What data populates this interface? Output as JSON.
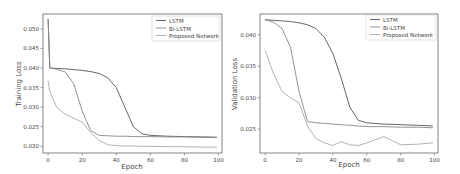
{
  "chart_data": [
    {
      "type": "line",
      "title": "",
      "xlabel": "Epoch",
      "ylabel": "Training Loss",
      "xlim": [
        -3,
        102
      ],
      "ylim": [
        0.0183,
        0.0538
      ],
      "xticks": [
        0,
        20,
        40,
        60,
        80,
        100
      ],
      "xtick_labels": [
        "0",
        "20",
        "40",
        "60",
        "80",
        "100"
      ],
      "yticks": [
        0.02,
        0.025,
        0.03,
        0.035,
        0.04,
        0.045,
        0.05
      ],
      "ytick_labels": [
        "0.020",
        "0.025",
        "0.030",
        "0.035",
        "0.040",
        "0.045",
        "0.050"
      ],
      "grid": false,
      "legend_position": "upper right",
      "x": [
        0,
        1,
        5,
        10,
        15,
        20,
        25,
        30,
        35,
        40,
        45,
        50,
        55,
        60,
        70,
        80,
        90,
        99
      ],
      "series": [
        {
          "name": "LSTM",
          "color": "#555555",
          "values": [
            0.0525,
            0.04,
            0.0399,
            0.0398,
            0.0396,
            0.0394,
            0.0391,
            0.0386,
            0.0375,
            0.035,
            0.03,
            0.025,
            0.0232,
            0.0228,
            0.0226,
            0.0225,
            0.0224,
            0.0223
          ]
        },
        {
          "name": "Bi-LSTM",
          "color": "#888888",
          "values": [
            0.0525,
            0.04,
            0.0397,
            0.039,
            0.036,
            0.029,
            0.024,
            0.0228,
            0.0227,
            0.0226,
            0.0226,
            0.0225,
            0.0225,
            0.0225,
            0.0224,
            0.0224,
            0.0223,
            0.0223
          ]
        },
        {
          "name": "Proposed Network",
          "color": "#aaaaaa",
          "values": [
            0.0368,
            0.034,
            0.03,
            0.0282,
            0.0272,
            0.0262,
            0.0235,
            0.0215,
            0.0204,
            0.0202,
            0.0201,
            0.0201,
            0.02,
            0.02,
            0.0199,
            0.0199,
            0.0198,
            0.0198
          ]
        }
      ]
    },
    {
      "type": "line",
      "title": "",
      "xlabel": "Epoch",
      "ylabel": "Validation Loss",
      "xlim": [
        -3,
        102
      ],
      "ylim": [
        0.0212,
        0.0433
      ],
      "xticks": [
        0,
        20,
        40,
        60,
        80,
        100
      ],
      "xtick_labels": [
        "0",
        "20",
        "40",
        "60",
        "80",
        "100"
      ],
      "yticks": [
        0.025,
        0.03,
        0.035,
        0.04
      ],
      "ytick_labels": [
        "0.025",
        "0.030",
        "0.035",
        "0.040"
      ],
      "grid": false,
      "legend_position": "upper right",
      "x": [
        0,
        5,
        10,
        15,
        20,
        25,
        30,
        35,
        40,
        45,
        50,
        55,
        60,
        70,
        80,
        90,
        99
      ],
      "series": [
        {
          "name": "LSTM",
          "color": "#555555",
          "values": [
            0.0424,
            0.0423,
            0.0422,
            0.0421,
            0.0419,
            0.0416,
            0.041,
            0.0396,
            0.037,
            0.033,
            0.0285,
            0.0264,
            0.026,
            0.0258,
            0.0257,
            0.0256,
            0.0255
          ]
        },
        {
          "name": "Bi-LSTM",
          "color": "#888888",
          "values": [
            0.0424,
            0.042,
            0.041,
            0.038,
            0.031,
            0.0262,
            0.026,
            0.0259,
            0.0258,
            0.0257,
            0.0256,
            0.0255,
            0.0254,
            0.0254,
            0.0253,
            0.0253,
            0.0252
          ]
        },
        {
          "name": "Proposed Network",
          "color": "#aaaaaa",
          "values": [
            0.0375,
            0.0338,
            0.031,
            0.03,
            0.0292,
            0.0255,
            0.0235,
            0.0228,
            0.0224,
            0.023,
            0.0225,
            0.0224,
            0.0228,
            0.0238,
            0.0225,
            0.0226,
            0.0228
          ]
        }
      ]
    }
  ],
  "panels": {
    "left": {
      "ylabel": "Training Loss",
      "xlabel": "Epoch",
      "legend": [
        "LSTM",
        "Bi-LSTM",
        "Proposed Network"
      ]
    },
    "right": {
      "ylabel": "Validation Loss",
      "xlabel": "Epoch",
      "legend": [
        "LSTM",
        "Bi-LSTM",
        "Proposed Network"
      ]
    }
  }
}
